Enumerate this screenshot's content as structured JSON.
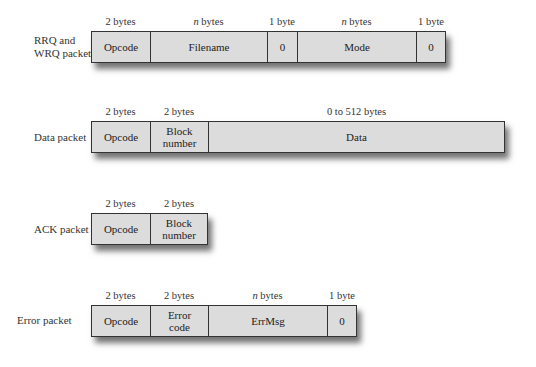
{
  "rows": [
    {
      "name": "rrq-wrq",
      "label": [
        "RRQ and",
        "WRQ packets"
      ],
      "fields": [
        {
          "name": "Opcode",
          "size_num": "2",
          "size_unit": "bytes"
        },
        {
          "name": "Filename",
          "size_num": "n",
          "size_unit": "bytes"
        },
        {
          "name": "0",
          "size_num": "1",
          "size_unit": "byte"
        },
        {
          "name": "Mode",
          "size_num": "n",
          "size_unit": "bytes"
        },
        {
          "name": "0",
          "size_num": "1",
          "size_unit": "byte"
        }
      ]
    },
    {
      "name": "data",
      "label": [
        "Data packet"
      ],
      "fields": [
        {
          "name": "Opcode",
          "size_num": "2",
          "size_unit": "bytes"
        },
        {
          "name": "Block number",
          "lines": [
            "Block",
            "number"
          ],
          "size_num": "2",
          "size_unit": "bytes"
        },
        {
          "name": "Data",
          "size_num": "0 to 512",
          "size_unit": "bytes"
        }
      ]
    },
    {
      "name": "ack",
      "label": [
        "ACK packet"
      ],
      "fields": [
        {
          "name": "Opcode",
          "size_num": "2",
          "size_unit": "bytes"
        },
        {
          "name": "Block number",
          "lines": [
            "Block",
            "number"
          ],
          "size_num": "2",
          "size_unit": "bytes"
        }
      ]
    },
    {
      "name": "error",
      "label": [
        "Error packet"
      ],
      "fields": [
        {
          "name": "Opcode",
          "size_num": "2",
          "size_unit": "bytes"
        },
        {
          "name": "Error code",
          "lines": [
            "Error",
            "code"
          ],
          "size_num": "2",
          "size_unit": "bytes"
        },
        {
          "name": "ErrMsg",
          "size_num": "n",
          "size_unit": "bytes"
        },
        {
          "name": "0",
          "size_num": "1",
          "size_unit": "byte"
        }
      ]
    }
  ],
  "colors": {
    "field_fill": "#dcdcdc",
    "border": "#333333",
    "shadow": "#000000"
  }
}
